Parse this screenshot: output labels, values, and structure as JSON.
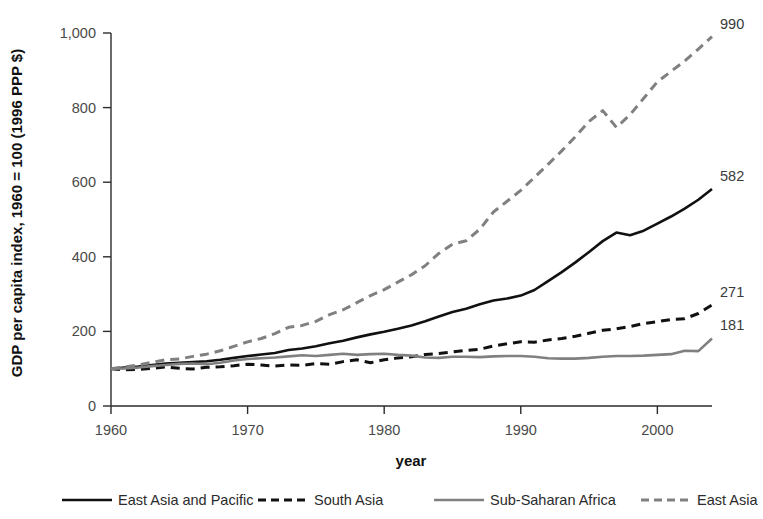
{
  "chart_data": {
    "type": "line",
    "title": "",
    "xlabel": "year",
    "ylabel": "GDP per capita index, 1960 = 100 (1996 PPP $)",
    "xlim": [
      1960,
      2004
    ],
    "ylim": [
      0,
      1000
    ],
    "grid": false,
    "legend_position": "bottom",
    "x_ticks": [
      1960,
      1970,
      1980,
      1990,
      2000
    ],
    "x_tick_labels": [
      "1960",
      "1970",
      "1980",
      "1990",
      "2000"
    ],
    "y_ticks": [
      0,
      200,
      400,
      600,
      800,
      1000
    ],
    "y_tick_labels": [
      "0",
      "200",
      "400",
      "600",
      "800",
      "1,000"
    ],
    "x": [
      1960,
      1961,
      1962,
      1963,
      1964,
      1965,
      1966,
      1967,
      1968,
      1969,
      1970,
      1971,
      1972,
      1973,
      1974,
      1975,
      1976,
      1977,
      1978,
      1979,
      1980,
      1981,
      1982,
      1983,
      1984,
      1985,
      1986,
      1987,
      1988,
      1989,
      1990,
      1991,
      1992,
      1993,
      1994,
      1995,
      1996,
      1997,
      1998,
      1999,
      2000,
      2001,
      2002,
      2003,
      2004
    ],
    "series": [
      {
        "name": "East Asia and Pacific",
        "color": "#111111",
        "style": "solid",
        "end_label": "582",
        "end_value": 582,
        "values": [
          100,
          103,
          106,
          110,
          114,
          116,
          118,
          120,
          124,
          129,
          134,
          138,
          142,
          150,
          154,
          160,
          168,
          175,
          184,
          192,
          199,
          207,
          216,
          227,
          240,
          252,
          261,
          273,
          283,
          288,
          296,
          311,
          335,
          359,
          385,
          413,
          442,
          465,
          458,
          470,
          489,
          508,
          529,
          553,
          582
        ]
      },
      {
        "name": "South Asia",
        "color": "#111111",
        "style": "dashed",
        "end_label": "271",
        "end_value": 271,
        "values": [
          100,
          97,
          98,
          101,
          105,
          101,
          99,
          104,
          105,
          108,
          112,
          110,
          107,
          110,
          109,
          114,
          112,
          119,
          124,
          116,
          124,
          129,
          132,
          138,
          141,
          145,
          149,
          152,
          161,
          167,
          172,
          171,
          177,
          181,
          187,
          195,
          203,
          207,
          213,
          221,
          226,
          232,
          234,
          248,
          271
        ]
      },
      {
        "name": "Sub-Saharan Africa",
        "color": "#808080",
        "style": "solid",
        "end_label": "181",
        "end_value": 181,
        "values": [
          100,
          101,
          103,
          107,
          110,
          113,
          114,
          112,
          116,
          122,
          126,
          128,
          130,
          133,
          136,
          134,
          137,
          140,
          137,
          139,
          140,
          137,
          135,
          130,
          129,
          132,
          132,
          131,
          133,
          134,
          134,
          132,
          128,
          127,
          127,
          129,
          132,
          134,
          134,
          135,
          137,
          139,
          148,
          147,
          181
        ]
      },
      {
        "name": "East Asia",
        "color": "#808080",
        "style": "dashed",
        "end_label": "990",
        "end_value": 990,
        "values": [
          100,
          105,
          110,
          117,
          124,
          126,
          133,
          139,
          148,
          160,
          172,
          181,
          194,
          211,
          216,
          227,
          245,
          258,
          277,
          296,
          312,
          332,
          352,
          376,
          409,
          434,
          443,
          474,
          520,
          549,
          578,
          613,
          648,
          684,
          722,
          763,
          792,
          747,
          781,
          825,
          869,
          897,
          925,
          957,
          990
        ]
      }
    ]
  },
  "legend": {
    "items": [
      {
        "label": "East Asia and Pacific",
        "swatch": "solid-black"
      },
      {
        "label": "South Asia",
        "swatch": "dashed-black"
      },
      {
        "label": "Sub-Saharan Africa",
        "swatch": "solid-gray"
      },
      {
        "label": "East Asia",
        "swatch": "dashed-gray"
      }
    ]
  }
}
